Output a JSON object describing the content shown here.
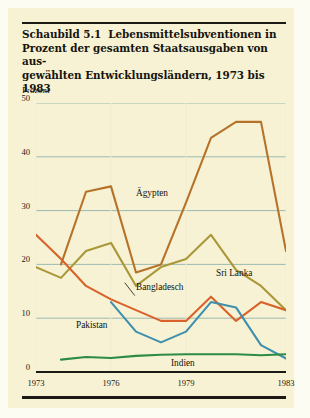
{
  "figure": {
    "number": "Schaubild 5.1",
    "title_lines": [
      "Lebensmittelsubventionen in",
      "Prozent der gesamten Staatsausgaben von aus-",
      "gewählten Entwicklungsländern, 1973 bis 1983"
    ],
    "axis_unit": "Prozent"
  },
  "chart_data": {
    "type": "line",
    "xlabel": "",
    "ylabel": "Prozent",
    "xlim": [
      1973,
      1983
    ],
    "ylim": [
      0,
      50
    ],
    "yticks": [
      0,
      10,
      20,
      30,
      40,
      50
    ],
    "xticks": [
      1973,
      1976,
      1979,
      1983
    ],
    "grid": "horizontal",
    "legend": "inline-labels",
    "x": [
      1973,
      1974,
      1975,
      1976,
      1977,
      1978,
      1979,
      1980,
      1981,
      1982,
      1983
    ],
    "series": [
      {
        "name": "Ägypten",
        "color": "#b5732a",
        "values": [
          null,
          20.0,
          33.5,
          34.5,
          18.5,
          20.0,
          31.5,
          43.5,
          46.5,
          46.5,
          22.5
        ],
        "label_x": 1977.0,
        "label_y": 33.0
      },
      {
        "name": "Sri Lanka",
        "color": "#a9983a",
        "values": [
          19.5,
          17.5,
          22.5,
          24.0,
          16.0,
          19.5,
          21.0,
          25.5,
          19.0,
          16.0,
          11.5
        ],
        "label_x": 1980.2,
        "label_y": 18.3
      },
      {
        "name": "Bangladesch",
        "color": "#d9622b",
        "values": [
          25.5,
          21.0,
          16.0,
          13.5,
          11.5,
          9.5,
          9.5,
          14.0,
          9.5,
          13.0,
          11.5
        ],
        "label_x": 1977.0,
        "label_y": 15.6
      },
      {
        "name": "Pakistan",
        "color": "#3f90ad",
        "values": [
          null,
          null,
          null,
          13.0,
          7.5,
          5.5,
          7.5,
          13.0,
          12.0,
          5.0,
          2.5
        ],
        "label_x": 1974.6,
        "label_y": 8.6
      },
      {
        "name": "Indien",
        "color": "#2d8b46",
        "values": [
          null,
          2.3,
          2.8,
          2.6,
          3.0,
          3.2,
          3.3,
          3.3,
          3.3,
          3.1,
          3.3
        ],
        "label_x": 1978.4,
        "label_y": 1.5
      }
    ]
  }
}
